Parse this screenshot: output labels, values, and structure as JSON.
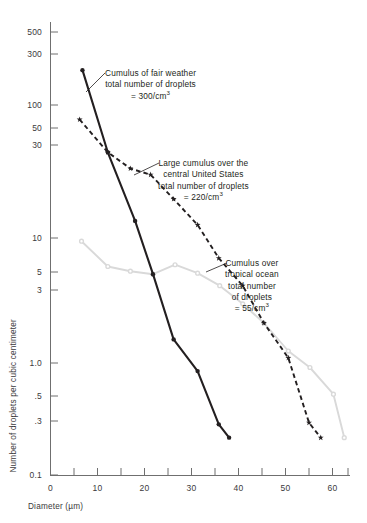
{
  "chart_data": {
    "type": "line",
    "title": "",
    "xlabel": "Diameter (µm)",
    "ylabel": "Number of droplets per cubic centimeter",
    "xlim": [
      0,
      65
    ],
    "ylim": [
      0.1,
      700
    ],
    "yscale": "log",
    "xscale": "linear",
    "grid": false,
    "legend_position": "annotations-inline",
    "xticks_major": [
      0,
      10,
      20,
      30,
      40,
      50,
      60
    ],
    "xticks_minor": [
      5,
      15,
      25,
      35,
      45,
      55,
      65
    ],
    "xtick_labels": [
      "0",
      "10",
      "20",
      "30",
      "40",
      "50",
      "60"
    ],
    "yticks": [
      500,
      300,
      100,
      50,
      30,
      10,
      5,
      3,
      1.0,
      0.5,
      0.3,
      0.1
    ],
    "ytick_labels": [
      "500",
      "300",
      "100",
      "50",
      "30",
      "10",
      "5",
      "3",
      "1.0",
      ".5",
      ".3",
      "0.1"
    ],
    "series": [
      {
        "name": "Cumulus of fair weather",
        "style": "solid",
        "color": "#231f20",
        "marker": "dot",
        "total_droplets": "300/cm3",
        "x": [
          6.8,
          12.2,
          18.0,
          21.8,
          26.2,
          31.3,
          35.8,
          38.0
        ],
        "y": [
          230,
          50,
          14.0,
          5.2,
          1.55,
          0.86,
          0.32,
          0.25
        ]
      },
      {
        "name": "Large cumulus over the central United States",
        "style": "dashed",
        "color": "#231f20",
        "marker": "star",
        "total_droplets": "220/cm3",
        "x": [
          6.2,
          12.2,
          17.0,
          21.3,
          26.2,
          31.3,
          35.8,
          40.9,
          45.4,
          50.6,
          55.0,
          57.5
        ],
        "y": [
          92,
          50,
          37,
          33,
          21,
          13.0,
          7.0,
          4.2,
          2.1,
          1.1,
          0.33,
          0.25
        ]
      },
      {
        "name": "Cumulus over tropical ocean",
        "style": "solid",
        "color": "#d9d9d9",
        "marker": "circle",
        "total_droplets": "55/cm3",
        "x": [
          6.6,
          12.2,
          17.0,
          21.8,
          26.5,
          31.3,
          36.0,
          40.9,
          45.4,
          50.6,
          55.2,
          60.2,
          62.5
        ],
        "y": [
          9.6,
          6.0,
          5.5,
          5.2,
          6.2,
          5.3,
          4.2,
          3.0,
          2.1,
          1.25,
          0.92,
          0.56,
          0.25
        ]
      }
    ],
    "annotations": [
      {
        "id": "fair",
        "lines": [
          "Cumulus of fair weather",
          "total number of droplets",
          "= 300/cm³"
        ],
        "target_series": "Cumulus of fair weather"
      },
      {
        "id": "large",
        "lines": [
          "Large cumulus over the",
          "central United States",
          "total number of droplets",
          "= 220/cm³"
        ],
        "target_series": "Large cumulus over the central United States"
      },
      {
        "id": "tropical",
        "lines": [
          "Cumulus over",
          "tropical ocean",
          "total number",
          "of droplets",
          "= 55/cm³"
        ],
        "target_series": "Cumulus over tropical ocean"
      }
    ]
  },
  "axis": {
    "x_title": "Diameter (µm)",
    "y_title": "Number of droplets per cubic centimeter",
    "x_labels": [
      "0",
      "10",
      "20",
      "30",
      "40",
      "50",
      "60"
    ],
    "y_labels": [
      "500",
      "300",
      "100",
      "50",
      "30",
      "10",
      "5",
      "3",
      "1.0",
      ".5",
      ".3",
      "0.1"
    ]
  },
  "annotations_text": {
    "fair": {
      "l1": "Cumulus of fair weather",
      "l2": "total number of droplets",
      "l3_prefix": "= 300/cm",
      "l3_sup": "3"
    },
    "large": {
      "l1": "Large cumulus over the",
      "l2": "central United States",
      "l3": "total number of droplets",
      "l4_prefix": "= 220/cm",
      "l4_sup": "3"
    },
    "tropical": {
      "l1": "Cumulus over",
      "l2": "tropical ocean",
      "l3": "total number",
      "l4": "of droplets",
      "l5_prefix": "= 55/cm",
      "l5_sup": "3"
    }
  },
  "colors": {
    "axis": "#6f6f6f",
    "ink": "#231f20",
    "gray_series": "#d9d9d9"
  }
}
